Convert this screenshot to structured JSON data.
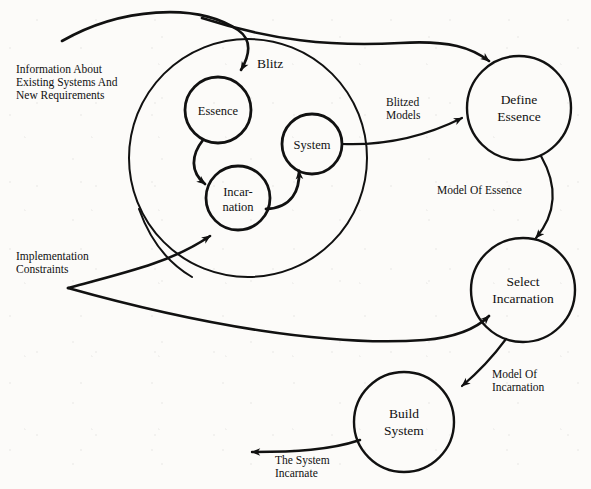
{
  "diagram": {
    "stroke_color": "#111111",
    "background_color": "#fcfbf9",
    "region": {
      "name": "blitz-region",
      "label": "Blitz",
      "label_x": 257,
      "label_y": 68,
      "cx": 248,
      "cy": 158,
      "r": 119
    },
    "nodes": [
      {
        "id": "essence",
        "label_line1": "Essence",
        "label_line2": "",
        "cx": 218,
        "cy": 110,
        "r": 33,
        "size": "small"
      },
      {
        "id": "incarnation",
        "label_line1": "Incar-",
        "label_line2": "nation",
        "cx": 238,
        "cy": 198,
        "r": 32,
        "size": "small"
      },
      {
        "id": "system",
        "label_line1": "System",
        "label_line2": "",
        "cx": 312,
        "cy": 144,
        "r": 30,
        "size": "small"
      },
      {
        "id": "define-essence",
        "label_line1": "Define",
        "label_line2": "Essence",
        "cx": 519,
        "cy": 108,
        "r": 52,
        "size": "large"
      },
      {
        "id": "select-incarnation",
        "label_line1": "Select",
        "label_line2": "Incarnation",
        "cx": 523,
        "cy": 290,
        "r": 52,
        "size": "large"
      },
      {
        "id": "build-system",
        "label_line1": "Build",
        "label_line2": "System",
        "cx": 404,
        "cy": 422,
        "r": 50,
        "size": "large"
      }
    ],
    "io_labels": [
      {
        "id": "information-about-existing-systems",
        "lines": [
          "Information About",
          "Existing Systems And",
          "New Requirements"
        ],
        "x": 16,
        "y": 73
      },
      {
        "id": "implementation-constraints",
        "lines": [
          "Implementation",
          "Constraints"
        ],
        "x": 16,
        "y": 260
      }
    ],
    "edge_labels": [
      {
        "id": "blitzed-models",
        "lines": [
          "Blitzed",
          "Models"
        ],
        "x": 386,
        "y": 106
      },
      {
        "id": "model-of-essence",
        "lines": [
          "Model Of Essence"
        ],
        "x": 437,
        "y": 194
      },
      {
        "id": "model-of-incarnation",
        "lines": [
          "Model Of",
          "Incarnation"
        ],
        "x": 492,
        "y": 378
      },
      {
        "id": "the-system-incarnate",
        "lines": [
          "The System",
          "Incarnate"
        ],
        "x": 275,
        "y": 464
      }
    ],
    "edges": [
      {
        "id": "input-to-essence",
        "from": "external-input",
        "to": "essence"
      },
      {
        "id": "input-to-define-essence",
        "from": "external-input",
        "to": "define-essence"
      },
      {
        "id": "essence-to-incarnation",
        "from": "essence",
        "to": "incarnation"
      },
      {
        "id": "incarnation-to-system",
        "from": "incarnation",
        "to": "system"
      },
      {
        "id": "system-to-define-essence",
        "from": "system",
        "to": "define-essence",
        "label": "blitzed-models"
      },
      {
        "id": "define-essence-to-select",
        "from": "define-essence",
        "to": "select-incarnation",
        "label": "model-of-essence"
      },
      {
        "id": "select-to-build-system",
        "from": "select-incarnation",
        "to": "build-system",
        "label": "model-of-incarnation"
      },
      {
        "id": "build-system-to-output",
        "from": "build-system",
        "to": "external-output",
        "label": "the-system-incarnate"
      },
      {
        "id": "constraints-to-incarnation",
        "from": "implementation-constraints",
        "to": "incarnation"
      },
      {
        "id": "constraints-to-select",
        "from": "implementation-constraints",
        "to": "select-incarnation"
      }
    ]
  }
}
